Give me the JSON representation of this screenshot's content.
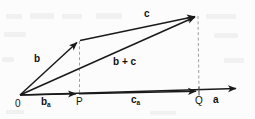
{
  "figure": {
    "type": "vector-diagram",
    "background_color": "#fcfcfc",
    "stroke_color": "#1a1a1a",
    "dashed_color": "#9a9a9a",
    "labels": {
      "origin": "0",
      "point_p": "P",
      "point_q": "Q",
      "vector_b": "b",
      "vector_c": "c",
      "vector_sum": "b + c",
      "vector_a_axis": "a",
      "proj_b_main": "b",
      "proj_b_sub": "a",
      "proj_c_main": "c",
      "proj_c_sub": "a"
    },
    "geometry": {
      "origin": [
        20,
        95
      ],
      "b_tip": [
        79,
        41
      ],
      "c_tip": [
        197,
        15
      ],
      "p": [
        79,
        93
      ],
      "q": [
        198,
        90
      ],
      "a_axis_end": [
        239,
        88
      ]
    }
  }
}
